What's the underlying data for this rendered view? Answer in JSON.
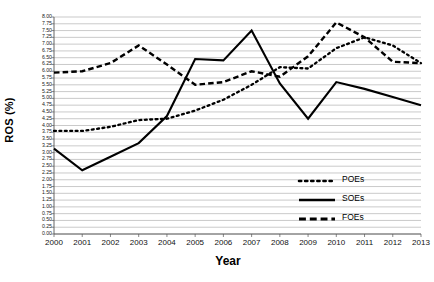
{
  "chart_data": {
    "type": "line",
    "title": "",
    "xlabel": "Year",
    "ylabel": "ROS (%)",
    "x": [
      2000,
      2001,
      2002,
      2003,
      2004,
      2005,
      2006,
      2007,
      2008,
      2009,
      2010,
      2011,
      2012,
      2013
    ],
    "categories": [
      "2000",
      "2001",
      "2002",
      "2003",
      "2004",
      "2005",
      "2006",
      "2007",
      "2008",
      "2009",
      "2010",
      "2011",
      "2012",
      "2013"
    ],
    "xlim": [
      2000,
      2013
    ],
    "ylim": [
      0.0,
      8.0
    ],
    "ytick_step": 0.25,
    "grid": true,
    "grid_axis": "y",
    "grid_color": "#b3b3b3",
    "legend_position": "inner-lower-right",
    "series": [
      {
        "name": "POEs",
        "style": "dotted",
        "color": "#000000",
        "values": [
          3.8,
          3.8,
          3.95,
          4.2,
          4.25,
          4.55,
          4.95,
          5.5,
          6.15,
          6.1,
          6.85,
          7.25,
          6.95,
          6.3
        ]
      },
      {
        "name": "SOEs",
        "style": "solid",
        "color": "#000000",
        "values": [
          3.15,
          2.35,
          2.85,
          3.35,
          4.35,
          6.45,
          6.4,
          7.5,
          5.55,
          4.25,
          5.6,
          5.35,
          5.05,
          4.75
        ]
      },
      {
        "name": "FOEs",
        "style": "dashed",
        "color": "#000000",
        "values": [
          5.95,
          6.0,
          6.3,
          6.95,
          6.25,
          5.5,
          5.6,
          6.0,
          5.8,
          6.55,
          7.8,
          7.25,
          6.35,
          6.3
        ]
      }
    ],
    "ytick_labels": [
      "0.00",
      "0.25",
      "0.50",
      "0.75",
      "1.00",
      "1.25",
      "1.50",
      "1.75",
      "2.00",
      "2.25",
      "2.50",
      "2.75",
      "3.00",
      "3.25",
      "3.50",
      "3.75",
      "4.00",
      "4.25",
      "4.50",
      "4.75",
      "5.00",
      "5.25",
      "5.50",
      "5.75",
      "6.00",
      "6.25",
      "6.50",
      "6.75",
      "7.00",
      "7.25",
      "7.50",
      "7.75",
      "8.00"
    ],
    "legend_entries": [
      {
        "label": "POEs",
        "style": "dotted"
      },
      {
        "label": "SOEs",
        "style": "solid"
      },
      {
        "label": "FOEs",
        "style": "dashed"
      }
    ]
  }
}
